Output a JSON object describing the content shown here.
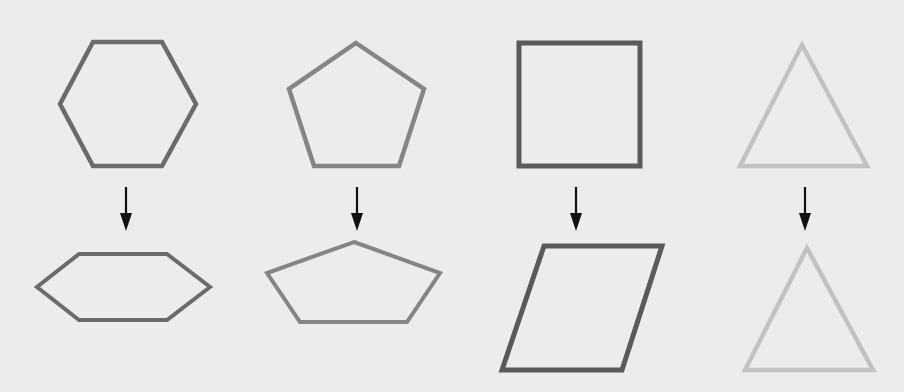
{
  "diagram": {
    "background": "#ececec",
    "columns": [
      {
        "name": "hexagon",
        "original": {
          "shape": "regular-hexagon",
          "stroke": "#6b6b6b",
          "stroke_width": 4.5,
          "points": [
            [
              93,
              42
            ],
            [
              162,
              42
            ],
            [
              196,
              104
            ],
            [
              162,
              166
            ],
            [
              93,
              166
            ],
            [
              60,
              104
            ]
          ]
        },
        "arrow": {
          "x": 126,
          "y1": 187,
          "y2": 231
        },
        "transformed": {
          "shape": "flattened-hexagon",
          "stroke": "#6b6b6b",
          "stroke_width": 4,
          "points": [
            [
              79,
              254
            ],
            [
              167,
              254
            ],
            [
              210,
              287
            ],
            [
              167,
              320
            ],
            [
              79,
              320
            ],
            [
              37,
              287
            ]
          ]
        }
      },
      {
        "name": "pentagon",
        "original": {
          "shape": "regular-pentagon",
          "stroke": "#858585",
          "stroke_width": 4.5,
          "points": [
            [
              356,
              43
            ],
            [
              424,
              89
            ],
            [
              399,
              166
            ],
            [
              314,
              166
            ],
            [
              289,
              89
            ]
          ]
        },
        "arrow": {
          "x": 357,
          "y1": 187,
          "y2": 231
        },
        "transformed": {
          "shape": "flattened-pentagon",
          "stroke": "#858585",
          "stroke_width": 4,
          "points": [
            [
              354,
              242
            ],
            [
              440,
              273
            ],
            [
              407,
              322
            ],
            [
              300,
              322
            ],
            [
              267,
              273
            ]
          ]
        }
      },
      {
        "name": "square",
        "original": {
          "shape": "square",
          "stroke": "#5a5a5a",
          "stroke_width": 5,
          "points": [
            [
              519,
              43
            ],
            [
              640,
              43
            ],
            [
              640,
              166
            ],
            [
              519,
              166
            ]
          ]
        },
        "arrow": {
          "x": 576,
          "y1": 187,
          "y2": 231
        },
        "transformed": {
          "shape": "parallelogram",
          "stroke": "#5a5a5a",
          "stroke_width": 5,
          "points": [
            [
              544,
              246
            ],
            [
              662,
              246
            ],
            [
              622,
              370
            ],
            [
              502,
              370
            ]
          ]
        }
      },
      {
        "name": "triangle",
        "original": {
          "shape": "equilateral-triangle",
          "stroke": "#c2c2c2",
          "stroke_width": 4.5,
          "points": [
            [
              802,
              45
            ],
            [
              867,
              166
            ],
            [
              740,
              166
            ]
          ]
        },
        "arrow": {
          "x": 805,
          "y1": 187,
          "y2": 231
        },
        "transformed": {
          "shape": "equilateral-triangle",
          "stroke": "#c2c2c2",
          "stroke_width": 4.5,
          "points": [
            [
              807,
              248
            ],
            [
              873,
              370
            ],
            [
              745,
              370
            ]
          ]
        }
      }
    ]
  }
}
